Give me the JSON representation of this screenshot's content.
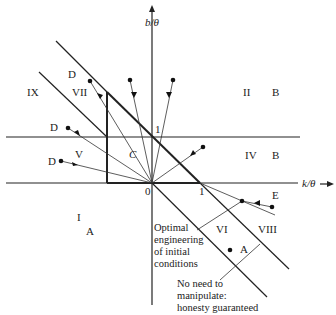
{
  "axes": {
    "x_label": "k/θ",
    "y_label": "b/θ",
    "origin_label": "0",
    "x_tick_label": "1",
    "y_tick_label": "1"
  },
  "regions": [
    {
      "id": "I",
      "label": "I",
      "outcome": "A"
    },
    {
      "id": "II",
      "label": "II",
      "outcome": "B"
    },
    {
      "id": "IV",
      "label": "IV",
      "outcome": "B"
    },
    {
      "id": "V",
      "label": "V",
      "outcome": "D"
    },
    {
      "id": "VI",
      "label": "VI",
      "outcome": "A"
    },
    {
      "id": "VII",
      "label": "VII",
      "outcome": "D"
    },
    {
      "id": "VIII",
      "label": "VIII",
      "outcome": "E"
    },
    {
      "id": "IX",
      "label": "IX",
      "outcome": ""
    }
  ],
  "labels": {
    "I": "I",
    "A_left": "A",
    "II": "II",
    "B_top": "B",
    "IV": "IV",
    "B_mid": "B",
    "V": "V",
    "D_v": "D",
    "VI": "VI",
    "A_right": "A",
    "VII": "VII",
    "D_vii": "D",
    "VIII": "VIII",
    "E": "E",
    "IX": "IX",
    "D_mid": "D",
    "C": "C"
  },
  "annotations": {
    "optimal": [
      "Optimal",
      "engineering",
      "of initial",
      "conditions"
    ],
    "honesty": [
      "No need to",
      "manipulate:",
      "honesty guaranteed"
    ]
  }
}
